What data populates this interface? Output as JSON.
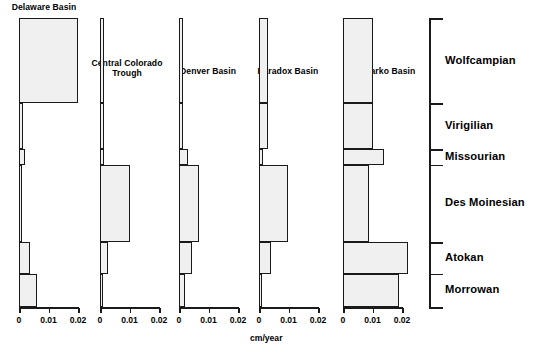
{
  "chart_data": {
    "type": "bar",
    "title": "",
    "subtitle": "",
    "orientation": "horizontal-stacked-by-stage",
    "xlabel": "cm/year",
    "ylabel": "",
    "xlim": [
      0,
      0.023
    ],
    "xticks": [
      0,
      0.01,
      0.02
    ],
    "xticklabels": [
      "0",
      "0.01",
      "0.02"
    ],
    "grid": false,
    "legend": null,
    "categories": [
      "Wolfcampian",
      "Virigilian",
      "Missourian",
      "Des Moinesian",
      "Atokan",
      "Morrowan"
    ],
    "stage_boundaries_fraction": [
      0.0,
      0.295,
      0.455,
      0.507,
      0.775,
      0.885,
      1.0
    ],
    "series": [
      {
        "name": "Delaware Basin",
        "values": [
          0.02,
          0.0012,
          0.0022,
          0.001,
          0.0037,
          0.006
        ]
      },
      {
        "name": "Central Colorado Trough",
        "values": [
          0.0013,
          0.0013,
          0.0013,
          0.01,
          0.0027,
          0.001
        ]
      },
      {
        "name": "Denver Basin",
        "values": [
          0.0013,
          0.0013,
          0.003,
          0.0067,
          0.0045,
          0.002
        ]
      },
      {
        "name": "Paradox Basin",
        "values": [
          0.0032,
          0.0032,
          0.0013,
          0.0098,
          0.004,
          0.0007
        ]
      },
      {
        "name": "Anadarko Basin",
        "values": [
          0.0103,
          0.0103,
          0.014,
          0.0088,
          0.022,
          0.019
        ]
      }
    ]
  },
  "panels": [
    {
      "title": "Delaware Basin",
      "axis_ticklabels": [
        "0",
        "0.01",
        "0.02"
      ]
    },
    {
      "title": "Central Colorado\nTrough",
      "axis_ticklabels": [
        "0",
        "0.01",
        "0.02"
      ]
    },
    {
      "title": "Denver Basin",
      "axis_ticklabels": [
        "0",
        "0.01",
        "0.02"
      ]
    },
    {
      "title": "Paradox Basin",
      "axis_ticklabels": [
        "0",
        "0.01",
        "0.02"
      ]
    },
    {
      "title": "Anadarko Basin",
      "axis_ticklabels": [
        "0",
        "0.01",
        "0.02"
      ]
    }
  ],
  "axis": {
    "unit_label": "cm/year",
    "tick_0": "0",
    "tick_1": "0.01",
    "tick_2": "0.02"
  },
  "stages": [
    {
      "name": "Wolfcampian"
    },
    {
      "name": "Virigilian"
    },
    {
      "name": "Missourian"
    },
    {
      "name": "Des Moinesian"
    },
    {
      "name": "Atokan"
    },
    {
      "name": "Morrowan"
    }
  ],
  "colors": {
    "bar_fill": "#f0f0f0",
    "bar_stroke": "#1a1a1a",
    "axis": "#1a1a1a",
    "text": "#000000",
    "background": "#ffffff"
  }
}
